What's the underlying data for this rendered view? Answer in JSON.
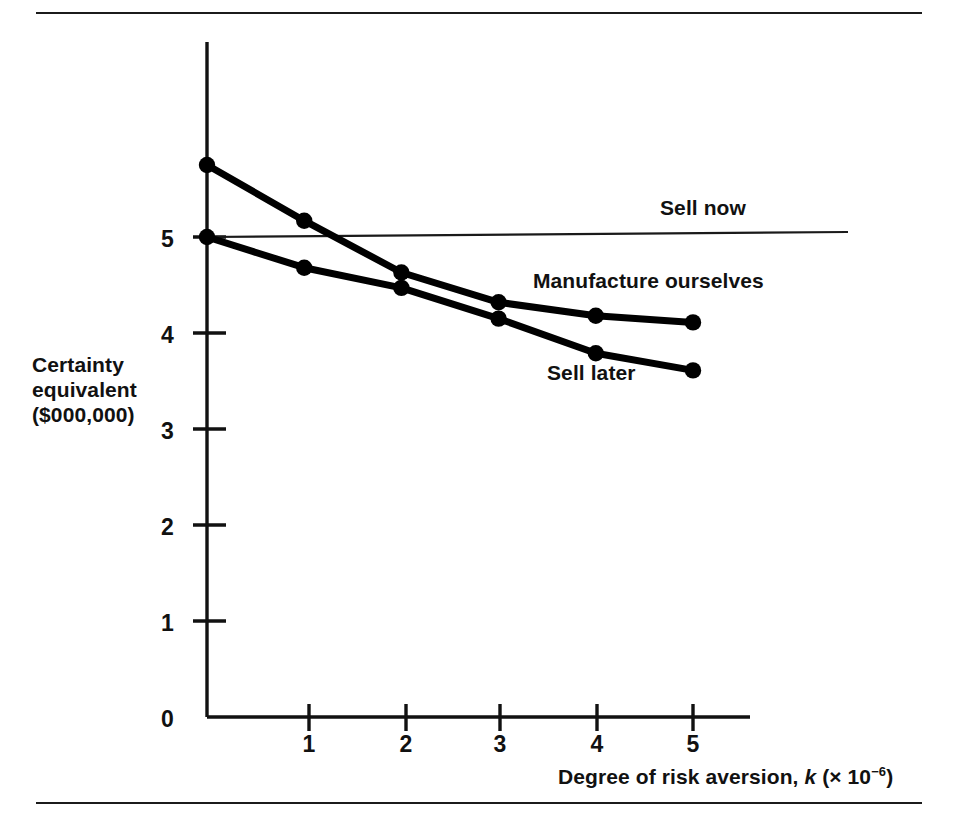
{
  "figure": {
    "top_rule": "",
    "bottom_rule": ""
  },
  "axes": {
    "y_title_line1": "Certainty",
    "y_title_line2": "equivalent",
    "y_title_line3": "($000,000)",
    "x_title_prefix": "Degree of risk aversion, ",
    "x_title_var": "k",
    "x_title_mid": " (× 10",
    "x_title_exp": "−6",
    "x_title_suffix": ")",
    "y_ticks": [
      "0",
      "1",
      "2",
      "3",
      "4",
      "5"
    ],
    "x_ticks": [
      "1",
      "2",
      "3",
      "4",
      "5"
    ]
  },
  "series_labels": {
    "sell_now": "Sell now",
    "manufacture": "Manufacture ourselves",
    "sell_later": "Sell later"
  },
  "colors": {
    "ink": "#111111",
    "background": "#ffffff",
    "curve": "#000000",
    "thin_line": "#222222"
  },
  "chart_data": {
    "type": "line",
    "title": "",
    "xlabel": "Degree of risk aversion, k (× 10⁻⁶)",
    "ylabel": "Certainty equivalent ($000,000)",
    "xlim": [
      0,
      5.4
    ],
    "ylim": [
      0,
      6.1
    ],
    "x_tick_values": [
      1,
      2,
      3,
      4,
      5
    ],
    "y_tick_values": [
      0,
      1,
      2,
      3,
      4,
      5
    ],
    "grid": false,
    "legend": "inline-annotations",
    "x": [
      0,
      1,
      2,
      3,
      4,
      5
    ],
    "series": [
      {
        "name": "Sell now",
        "style": "thin-horizontal-line",
        "markers": false,
        "values": [
          5.0,
          5.0,
          5.0,
          5.0,
          5.0,
          5.0
        ],
        "annotation": "Sell now",
        "annotation_at": {
          "x": 4.7,
          "y": 5.25
        }
      },
      {
        "name": "Manufacture ourselves",
        "style": "thick-line-with-dots",
        "markers": true,
        "values": [
          5.75,
          5.17,
          4.63,
          4.32,
          4.18,
          4.11
        ],
        "annotation": "Manufacture ourselves",
        "annotation_at": {
          "x": 3.4,
          "y": 4.5
        }
      },
      {
        "name": "Sell later",
        "style": "thick-line-with-dots",
        "markers": true,
        "values": [
          5.0,
          4.68,
          4.47,
          4.15,
          3.79,
          3.61
        ],
        "annotation": "Sell later",
        "annotation_at": {
          "x": 3.5,
          "y": 3.55
        }
      }
    ]
  }
}
